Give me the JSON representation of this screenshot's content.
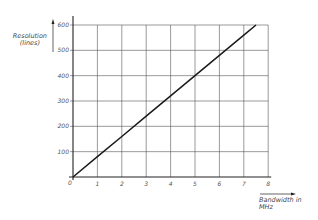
{
  "chart_data": {
    "type": "line",
    "title": "",
    "xlabel": "Bandwidth in MHz",
    "xlabel_lines": [
      "Bandwidth in",
      "MHz"
    ],
    "ylabel": "Resolution (lines)",
    "ylabel_lines": [
      "Resolution",
      "(lines)"
    ],
    "xlim": [
      0,
      8
    ],
    "ylim": [
      0,
      600
    ],
    "x_ticks": [
      0,
      1,
      2,
      3,
      4,
      5,
      6,
      7,
      8
    ],
    "y_ticks": [
      100,
      200,
      300,
      400,
      500,
      600
    ],
    "origin_label": "0",
    "grid": true,
    "legend": null,
    "series": [
      {
        "name": "Resolution vs Bandwidth",
        "x": [
          0,
          1,
          2,
          3,
          4,
          5,
          6,
          7,
          7.5
        ],
        "y": [
          0,
          80,
          160,
          240,
          320,
          400,
          480,
          560,
          600
        ]
      }
    ],
    "colors": {
      "line": "#1a1a1a",
      "grid": "#555555",
      "axis": "#222222",
      "text": "#555555"
    }
  }
}
